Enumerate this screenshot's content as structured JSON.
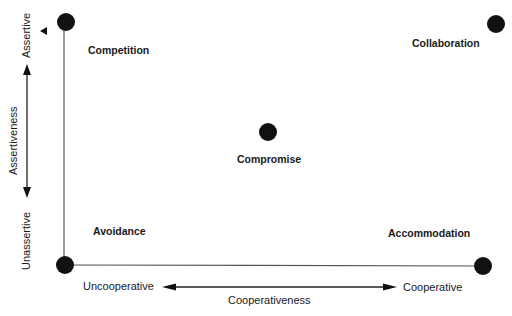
{
  "diagram": {
    "x_axis": {
      "label": "Cooperativeness",
      "low": "Uncooperative",
      "high": "Cooperative"
    },
    "y_axis": {
      "label": "Assertiveness",
      "low": "Unassertive",
      "high": "Assertive"
    },
    "modes": [
      {
        "name": "Competition",
        "assertive": "high",
        "cooperative": "low"
      },
      {
        "name": "Collaboration",
        "assertive": "high",
        "cooperative": "high"
      },
      {
        "name": "Compromise",
        "assertive": "medium",
        "cooperative": "medium"
      },
      {
        "name": "Avoidance",
        "assertive": "low",
        "cooperative": "low"
      },
      {
        "name": "Accommodation",
        "assertive": "low",
        "cooperative": "high"
      }
    ],
    "colors": {
      "ink": "#1a1a1a",
      "line": "#555555",
      "background": "#ffffff"
    }
  }
}
